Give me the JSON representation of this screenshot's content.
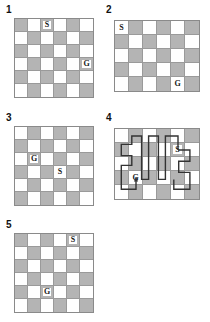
{
  "figure": {
    "background": "#ffffff",
    "shade_color": "#b4b4b4",
    "empty_color": "#ffffff",
    "grid_line_color": "#9a9a9a",
    "border_color": "#8a8a8a",
    "path_color": "#333333",
    "marker_start": "S",
    "marker_goal": "G"
  },
  "panels": [
    {
      "label": "1",
      "cols": 6,
      "rows": 6,
      "x": 14,
      "y": 18,
      "cell": 13,
      "label_x": 6,
      "label_y": 5,
      "parity": 0,
      "markers": [
        {
          "name": "start",
          "text": "S",
          "row": 1,
          "col": 3
        },
        {
          "name": "goal",
          "text": "G",
          "row": 4,
          "col": 6
        }
      ],
      "path": null
    },
    {
      "label": "2",
      "cols": 6,
      "rows": 5,
      "x": 114,
      "y": 20,
      "cell": 14,
      "label_x": 106,
      "label_y": 5,
      "parity": 1,
      "markers": [
        {
          "name": "start",
          "text": "S",
          "row": 1,
          "col": 1
        },
        {
          "name": "goal",
          "text": "G",
          "row": 5,
          "col": 5
        }
      ],
      "path": null
    },
    {
      "label": "3",
      "cols": 6,
      "rows": 6,
      "x": 14,
      "y": 126,
      "cell": 13,
      "label_x": 6,
      "label_y": 113,
      "parity": 1,
      "markers": [
        {
          "name": "goal",
          "text": "G",
          "row": 3,
          "col": 2
        },
        {
          "name": "start",
          "text": "S",
          "row": 4,
          "col": 4
        }
      ],
      "path": null
    },
    {
      "label": "4",
      "cols": 6,
      "rows": 5,
      "x": 114,
      "y": 128,
      "cell": 14,
      "label_x": 106,
      "label_y": 113,
      "parity": 1,
      "markers": [
        {
          "name": "start",
          "text": "S",
          "row": 2,
          "col": 5
        },
        {
          "name": "goal",
          "text": "G",
          "row": 4,
          "col": 2
        }
      ],
      "path": {
        "description": "serpentine solution route traced from S to G",
        "stroke_width": 1.4,
        "arrow_at": "goal",
        "points": [
          [
            4.5,
            1.5
          ],
          [
            4.5,
            0.5
          ],
          [
            3.6,
            0.5
          ],
          [
            3.6,
            3.6
          ],
          [
            3.1,
            3.6
          ],
          [
            3.1,
            0.5
          ],
          [
            2.4,
            0.5
          ],
          [
            2.4,
            3.6
          ],
          [
            1.9,
            3.6
          ],
          [
            1.9,
            0.5
          ],
          [
            1.2,
            0.5
          ],
          [
            1.2,
            1.1
          ],
          [
            0.45,
            1.1
          ],
          [
            0.45,
            1.9
          ],
          [
            1.2,
            1.9
          ],
          [
            1.2,
            2.6
          ],
          [
            0.45,
            2.6
          ],
          [
            0.45,
            4.3
          ],
          [
            1.5,
            4.3
          ],
          [
            1.5,
            3.45
          ]
        ],
        "points2": [
          [
            4.5,
            1.5
          ],
          [
            5.35,
            1.5
          ],
          [
            5.35,
            2.3
          ],
          [
            4.55,
            2.3
          ],
          [
            4.55,
            3.1
          ],
          [
            5.35,
            3.1
          ],
          [
            5.35,
            4.3
          ],
          [
            4.2,
            4.3
          ],
          [
            4.2,
            3.6
          ]
        ]
      }
    },
    {
      "label": "5",
      "cols": 6,
      "rows": 6,
      "x": 14,
      "y": 233,
      "cell": 13,
      "label_x": 6,
      "label_y": 220,
      "parity": 0,
      "markers": [
        {
          "name": "start",
          "text": "S",
          "row": 1,
          "col": 5
        },
        {
          "name": "goal",
          "text": "G",
          "row": 5,
          "col": 3
        }
      ],
      "path": null
    }
  ]
}
